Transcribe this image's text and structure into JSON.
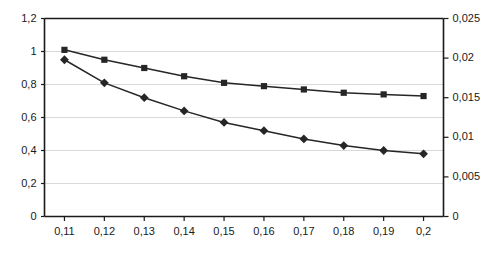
{
  "chart_data": {
    "type": "line",
    "title": "",
    "subtitle": "",
    "xlabel": "",
    "ylabel": "",
    "grid": true,
    "legend": "none",
    "x": [
      0.11,
      0.12,
      0.13,
      0.14,
      0.15,
      0.16,
      0.17,
      0.18,
      0.19,
      0.2
    ],
    "categories": [
      "0,11",
      "0,12",
      "0,13",
      "0,14",
      "0,15",
      "0,16",
      "0,17",
      "0,18",
      "0,19",
      "0,2"
    ],
    "xlim": [
      0.105,
      0.205
    ],
    "ylim": [
      0,
      1.2
    ],
    "ylim_right": [
      0,
      0.025
    ],
    "y_left_ticks": [
      "0",
      "0,2",
      "0,4",
      "0,6",
      "0,8",
      "1",
      "1,2"
    ],
    "y_left_tick_values": [
      0,
      0.2,
      0.4,
      0.6,
      0.8,
      1,
      1.2
    ],
    "y_right_ticks": [
      "0",
      "0,005",
      "0,01",
      "0,015",
      "0,02",
      "0,025"
    ],
    "y_right_tick_values": [
      0,
      0.005,
      0.01,
      0.015,
      0.02,
      0.025
    ],
    "series": [
      {
        "name": "square-series",
        "marker": "square",
        "axis": "left",
        "color": "#262626",
        "values": [
          1.01,
          0.95,
          0.9,
          0.85,
          0.81,
          0.79,
          0.77,
          0.75,
          0.74,
          0.73
        ]
      },
      {
        "name": "diamond-series",
        "marker": "diamond",
        "axis": "left",
        "color": "#262626",
        "values": [
          0.95,
          0.81,
          0.72,
          0.64,
          0.57,
          0.52,
          0.47,
          0.43,
          0.4,
          0.38
        ]
      }
    ]
  },
  "colors": {
    "plot_border": "#1a1a1a",
    "gridline": "#d9d9d9",
    "series_line": "#333333",
    "marker_fill": "#262626",
    "text": "#1a1a1a",
    "background": "#ffffff"
  }
}
